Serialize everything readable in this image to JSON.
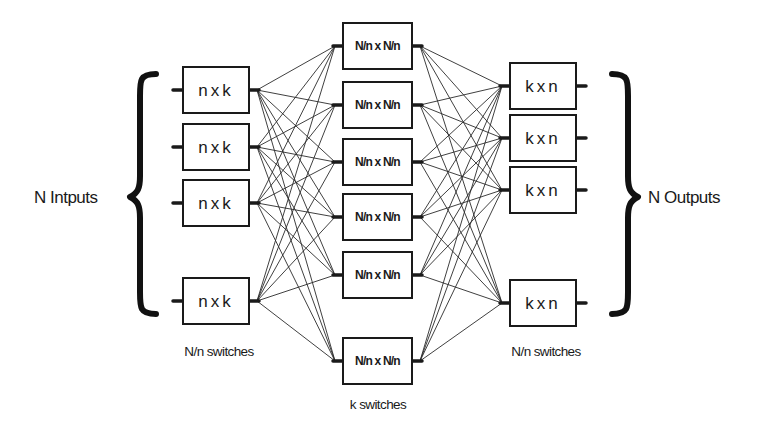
{
  "diagram": {
    "input_label": "N Intputs",
    "output_label": "N Outputs",
    "left_stage": {
      "caption": "N/n switches",
      "box_label": "n x k",
      "boxes": [
        {
          "label": "n x k",
          "y": 67
        },
        {
          "label": "n x k",
          "y": 124
        },
        {
          "label": "n x k",
          "y": 180
        },
        {
          "label": "n x k",
          "y": 278
        }
      ]
    },
    "middle_stage": {
      "caption": "k switches",
      "box_label": "N/n x N/n",
      "boxes": [
        {
          "label": "N/n x N/n",
          "y": 23
        },
        {
          "label": "N/n x N/n",
          "y": 82
        },
        {
          "label": "N/n x N/n",
          "y": 139
        },
        {
          "label": "N/n x N/n",
          "y": 194
        },
        {
          "label": "N/n x N/n",
          "y": 252
        },
        {
          "label": "N/n x N/n",
          "y": 338
        }
      ]
    },
    "right_stage": {
      "caption": "N/n switches",
      "box_label": "k x n",
      "boxes": [
        {
          "label": "k x n",
          "y": 63
        },
        {
          "label": "k x n",
          "y": 115
        },
        {
          "label": "k x n",
          "y": 167
        },
        {
          "label": "k x n",
          "y": 280
        }
      ]
    },
    "colors": {
      "line": "#1a1a1a",
      "background": "#ffffff"
    }
  }
}
